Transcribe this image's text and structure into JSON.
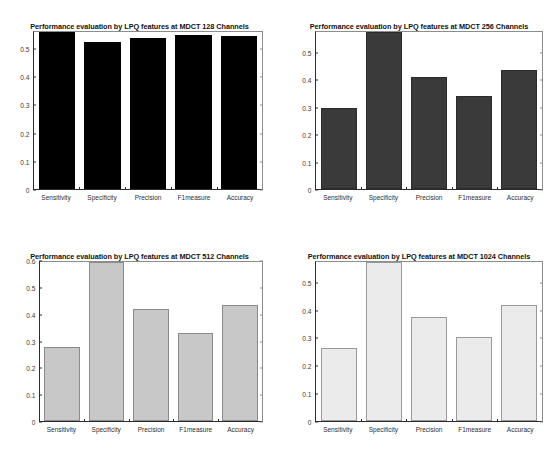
{
  "figure": {
    "background": "#ffffff",
    "panel_count": 4
  },
  "chart_data": [
    {
      "id": "mdct-128",
      "type": "bar",
      "title": "Performance evaluation by LPQ features at MDCT 128 Channels",
      "xlabel": "",
      "ylabel": "",
      "categories": [
        "Sensitivity",
        "Specificity",
        "Precision",
        "F1measure",
        "Accuracy"
      ],
      "values": [
        0.563,
        0.528,
        0.54,
        0.553,
        0.547
      ],
      "ylim": [
        0,
        0.563
      ],
      "yticks": [
        0,
        0.1,
        0.2,
        0.3,
        0.4,
        0.5
      ],
      "ytick_labels": [
        "0",
        "0.1",
        "0.2",
        "0.3",
        "0.4",
        "0.5"
      ],
      "bar_color": "#000000",
      "bar_edge_color": "#000000",
      "grid": false,
      "legend": "none"
    },
    {
      "id": "mdct-256",
      "type": "bar",
      "title": "Performance evaluation by LPQ features at MDCT 256 Channels",
      "xlabel": "",
      "ylabel": "",
      "categories": [
        "Sensitivity",
        "Specificity",
        "Precision",
        "F1measure",
        "Accuracy"
      ],
      "values": [
        0.3,
        0.58,
        0.412,
        0.345,
        0.438
      ],
      "ylim": [
        0,
        0.58
      ],
      "yticks": [
        0,
        0.1,
        0.2,
        0.3,
        0.4,
        0.5
      ],
      "ytick_labels": [
        "0",
        "0.1",
        "0.2",
        "0.3",
        "0.4",
        "0.5"
      ],
      "bar_color": "#3a3a3a",
      "bar_edge_color": "#2b2b2b",
      "grid": false,
      "legend": "none"
    },
    {
      "id": "mdct-512",
      "type": "bar",
      "title": "Performance evaluation by LPQ features at MDCT 512 Channels",
      "xlabel": "",
      "ylabel": "",
      "categories": [
        "Sensitivity",
        "Specificity",
        "Precision",
        "F1measure",
        "Accuracy"
      ],
      "values": [
        0.281,
        0.6,
        0.423,
        0.332,
        0.437
      ],
      "ylim": [
        0,
        0.6
      ],
      "yticks": [
        0,
        0.1,
        0.2,
        0.3,
        0.4,
        0.5,
        0.6
      ],
      "ytick_labels": [
        "0",
        "0.1",
        "0.2",
        "0.3",
        "0.4",
        "0.5",
        "0.6"
      ],
      "bar_color": "#c8c8c8",
      "bar_edge_color": "#8a8a8a",
      "grid": false,
      "legend": "none"
    },
    {
      "id": "mdct-1024",
      "type": "bar",
      "title": "Performance evaluation by LPQ features at MDCT 1024 Channels",
      "xlabel": "",
      "ylabel": "",
      "categories": [
        "Sensitivity",
        "Specificity",
        "Precision",
        "F1measure",
        "Accuracy"
      ],
      "values": [
        0.266,
        0.578,
        0.377,
        0.307,
        0.422
      ],
      "ylim": [
        0,
        0.578
      ],
      "yticks": [
        0,
        0.1,
        0.2,
        0.3,
        0.4,
        0.5
      ],
      "ytick_labels": [
        "0",
        "0.1",
        "0.2",
        "0.3",
        "0.4",
        "0.5"
      ],
      "bar_color": "#ebebeb",
      "bar_edge_color": "#9a9a9a",
      "grid": false,
      "legend": "none"
    }
  ]
}
